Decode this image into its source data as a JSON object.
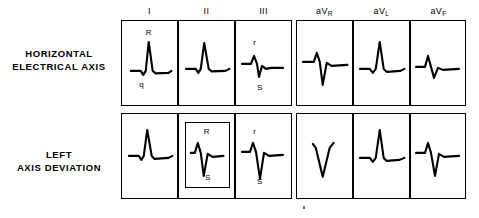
{
  "figure": {
    "background_color": "#ffffff",
    "ink_color": "#000000"
  },
  "row_labels": [
    {
      "id": "horizontal-electrical-axis",
      "line1": "HORIZONTAL",
      "line2": "ELECTRICAL AXIS"
    },
    {
      "id": "left-axis-deviation",
      "line1": "LEFT",
      "line2": "AXIS DEVIATION"
    }
  ],
  "column_headers": [
    {
      "id": "lead-1",
      "base": "I",
      "sub": ""
    },
    {
      "id": "lead-2",
      "base": "II",
      "sub": ""
    },
    {
      "id": "lead-3",
      "base": "III",
      "sub": ""
    },
    {
      "id": "lead-avr",
      "base": "aV",
      "sub": "R"
    },
    {
      "id": "lead-avl",
      "base": "aV",
      "sub": "L"
    },
    {
      "id": "lead-avf",
      "base": "aV",
      "sub": "F"
    }
  ],
  "rows": [
    {
      "id": "row-horizontal-electrical-axis",
      "label": "HORIZONTAL ELECTRICAL AXIS",
      "cells": [
        {
          "id": "cell-r1-lead1",
          "lead": "I",
          "waveform": "tall-positive-R-with-small-q",
          "annotations": [
            {
              "id": "annot-r1-lead1-R",
              "text": "R",
              "position": "above"
            },
            {
              "id": "annot-r1-lead1-q",
              "text": "q",
              "position": "below"
            }
          ],
          "highlighted": false
        },
        {
          "id": "cell-r1-lead2",
          "lead": "II",
          "waveform": "tall-positive-R",
          "annotations": [],
          "highlighted": false
        },
        {
          "id": "cell-r1-lead3",
          "lead": "III",
          "waveform": "small-r-with-S",
          "annotations": [
            {
              "id": "annot-r1-lead3-r",
              "text": "r",
              "position": "above"
            },
            {
              "id": "annot-r1-lead3-S",
              "text": "S",
              "position": "below"
            }
          ],
          "highlighted": false
        },
        {
          "id": "cell-r1-avr",
          "lead": "aVR",
          "waveform": "small-r-with-deep-S",
          "annotations": [],
          "highlighted": false
        },
        {
          "id": "cell-r1-avl",
          "lead": "aVL",
          "waveform": "tall-positive-R",
          "annotations": [],
          "highlighted": false
        },
        {
          "id": "cell-r1-avf",
          "lead": "aVF",
          "waveform": "small-r-with-S",
          "annotations": [],
          "highlighted": false
        }
      ]
    },
    {
      "id": "row-left-axis-deviation",
      "label": "LEFT AXIS DEVIATION",
      "cells": [
        {
          "id": "cell-r2-lead1",
          "lead": "I",
          "waveform": "tall-positive-R",
          "annotations": [],
          "highlighted": false
        },
        {
          "id": "cell-r2-lead2",
          "lead": "II",
          "waveform": "small-r-with-deep-S",
          "annotations": [
            {
              "id": "annot-r2-lead2-R",
              "text": "R",
              "position": "above"
            },
            {
              "id": "annot-r2-lead2-S",
              "text": "S",
              "position": "below"
            }
          ],
          "highlighted": true
        },
        {
          "id": "cell-r2-lead3",
          "lead": "III",
          "waveform": "small-r-with-deep-S",
          "annotations": [
            {
              "id": "annot-r2-lead3-r",
              "text": "r",
              "position": "above"
            },
            {
              "id": "annot-r2-lead3-S",
              "text": "S",
              "position": "below"
            }
          ],
          "highlighted": false
        },
        {
          "id": "cell-r2-avr",
          "lead": "aVR",
          "waveform": "deep-QS",
          "annotations": [],
          "highlighted": false
        },
        {
          "id": "cell-r2-avl",
          "lead": "aVL",
          "waveform": "tall-positive-R",
          "annotations": [],
          "highlighted": false
        },
        {
          "id": "cell-r2-avf",
          "lead": "aVF",
          "waveform": "small-r-with-deep-S",
          "annotations": [],
          "highlighted": false
        }
      ]
    }
  ]
}
